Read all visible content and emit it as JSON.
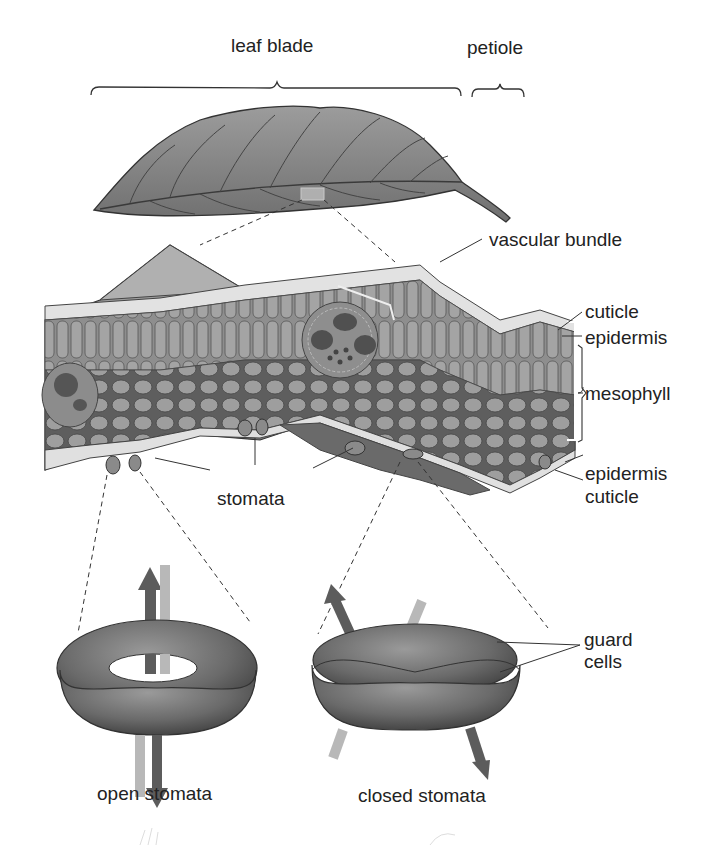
{
  "labels": {
    "leaf_blade": "leaf blade",
    "petiole": "petiole",
    "vascular_bundle": "vascular bundle",
    "cuticle_top": "cuticle",
    "epidermis_top": "epidermis",
    "mesophyll": "mesophyll",
    "epidermis_bottom": "epidermis",
    "cuticle_bottom": "cuticle",
    "stomata": "stomata",
    "guard_cells_line1": "guard",
    "guard_cells_line2": "cells",
    "open_stomata": "open stomata",
    "closed_stomata": "closed stomata"
  },
  "colors": {
    "ink": "#222222",
    "leaf_fill": "#8a8a8a",
    "cell_light": "#d8d8d8",
    "cell_mid": "#9a9a9a",
    "cell_dark": "#5a5a5a",
    "guard_cell": "#6e6e6e",
    "arrow_dark": "#5c5c5c",
    "arrow_light": "#b8b8b8"
  }
}
